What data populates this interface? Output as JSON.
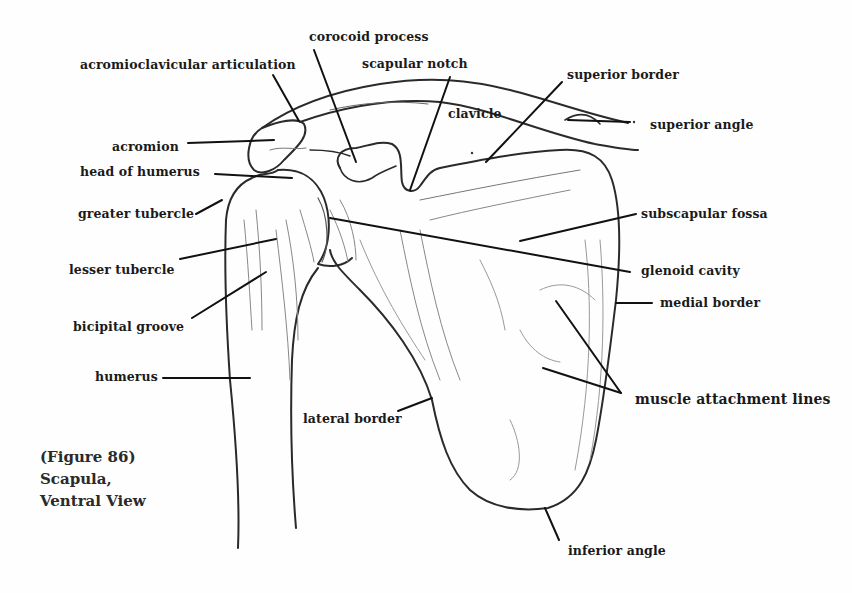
{
  "figure": {
    "caption": {
      "line1": "(Figure 86)",
      "line2": "Scapula,",
      "line3": "Ventral View"
    },
    "ink_color": "#1a1a1a",
    "background_color": "#fefefe"
  },
  "labels": [
    {
      "id": "corocoid-process",
      "text": "corocoid process",
      "x": 309,
      "y": 30
    },
    {
      "id": "acromioclavicular-articulation",
      "text": "acromioclavicular articulation",
      "x": 80,
      "y": 58
    },
    {
      "id": "scapular-notch",
      "text": "scapular notch",
      "x": 362,
      "y": 57
    },
    {
      "id": "superior-border",
      "text": "superior border",
      "x": 567,
      "y": 68
    },
    {
      "id": "clavicle",
      "text": "clavicle",
      "x": 448,
      "y": 107
    },
    {
      "id": "superior-angle",
      "text": "superior angle",
      "x": 650,
      "y": 118
    },
    {
      "id": "acromion",
      "text": "acromion",
      "x": 112,
      "y": 140
    },
    {
      "id": "head-of-humerus",
      "text": "head of humerus",
      "x": 80,
      "y": 165
    },
    {
      "id": "greater-tubercle",
      "text": "greater tubercle",
      "x": 78,
      "y": 207
    },
    {
      "id": "subscapular-fossa",
      "text": "subscapular fossa",
      "x": 641,
      "y": 207
    },
    {
      "id": "lesser-tubercle",
      "text": "lesser tubercle",
      "x": 69,
      "y": 263
    },
    {
      "id": "glenoid-cavity",
      "text": "glenoid cavity",
      "x": 641,
      "y": 264
    },
    {
      "id": "medial-border",
      "text": "medial border",
      "x": 660,
      "y": 296
    },
    {
      "id": "bicipital-groove",
      "text": "bicipital groove",
      "x": 73,
      "y": 320
    },
    {
      "id": "humerus",
      "text": "humerus",
      "x": 95,
      "y": 370
    },
    {
      "id": "muscle-attachment-lines",
      "text": "muscle attachment lines",
      "x": 635,
      "y": 392,
      "big": true
    },
    {
      "id": "lateral-border",
      "text": "lateral border",
      "x": 303,
      "y": 412
    },
    {
      "id": "inferior-angle",
      "text": "inferior angle",
      "x": 568,
      "y": 544
    }
  ],
  "leader_lines": [
    {
      "for": "corocoid-process",
      "x1": 314,
      "y1": 50,
      "x2": 356,
      "y2": 162
    },
    {
      "for": "acromioclavicular-articulation",
      "x1": 273,
      "y1": 75,
      "x2": 299,
      "y2": 121
    },
    {
      "for": "scapular-notch",
      "x1": 450,
      "y1": 77,
      "x2": 410,
      "y2": 190
    },
    {
      "for": "superior-border",
      "x1": 562,
      "y1": 82,
      "x2": 486,
      "y2": 162
    },
    {
      "for": "superior-angle",
      "x1": 568,
      "y1": 120,
      "x2": 630,
      "y2": 122
    },
    {
      "for": "acromion",
      "x1": 188,
      "y1": 143,
      "x2": 274,
      "y2": 140
    },
    {
      "for": "head-of-humerus",
      "x1": 215,
      "y1": 174,
      "x2": 292,
      "y2": 178
    },
    {
      "for": "greater-tubercle",
      "x1": 196,
      "y1": 214,
      "x2": 222,
      "y2": 200
    },
    {
      "for": "subscapular-fossa",
      "x1": 520,
      "y1": 241,
      "x2": 636,
      "y2": 214
    },
    {
      "for": "glenoid-cavity",
      "x1": 330,
      "y1": 218,
      "x2": 630,
      "y2": 272
    },
    {
      "for": "lesser-tubercle",
      "x1": 180,
      "y1": 259,
      "x2": 276,
      "y2": 239
    },
    {
      "for": "medial-border",
      "x1": 616,
      "y1": 303,
      "x2": 652,
      "y2": 303
    },
    {
      "for": "bicipital-groove",
      "x1": 192,
      "y1": 318,
      "x2": 266,
      "y2": 272
    },
    {
      "for": "humerus",
      "x1": 163,
      "y1": 378,
      "x2": 250,
      "y2": 378
    },
    {
      "for": "muscle-attachment-lines-a",
      "x1": 556,
      "y1": 301,
      "x2": 621,
      "y2": 393
    },
    {
      "for": "muscle-attachment-lines-b",
      "x1": 543,
      "y1": 368,
      "x2": 621,
      "y2": 393
    },
    {
      "for": "lateral-border",
      "x1": 398,
      "y1": 411,
      "x2": 432,
      "y2": 398
    },
    {
      "for": "inferior-angle",
      "x1": 545,
      "y1": 508,
      "x2": 559,
      "y2": 540
    }
  ]
}
